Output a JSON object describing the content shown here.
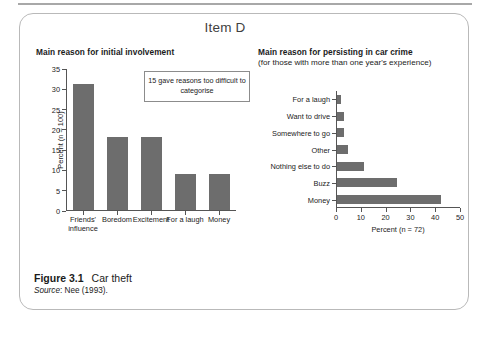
{
  "item": {
    "title": "Item D"
  },
  "left_chart": {
    "title": "Main reason for initial involvement",
    "note": "15 gave reasons too difficult to categorise"
  },
  "right_chart": {
    "title": "Main reason for persisting in car crime",
    "subtitle": "(for those with more than one year's experience)"
  },
  "caption": {
    "figure_number": "Figure 3.1",
    "figure_title": "Car theft",
    "source_label": "Source",
    "source_text": ": Nee (1993)."
  },
  "colors": {
    "bar": "#6d6d6d",
    "axis": "#555555",
    "box_border": "#b9b9b9",
    "note_border": "#8c8c8c",
    "rule": "#a8a8a8"
  },
  "chart_data": [
    {
      "type": "bar",
      "orientation": "vertical",
      "title": "Main reason for initial involvement",
      "categories": [
        "Friends' influence",
        "Boredom",
        "Excitement",
        "For a laugh",
        "Money"
      ],
      "values": [
        31,
        18,
        18,
        9,
        9
      ],
      "xlabel": "",
      "ylabel": "Percent (n = 100)",
      "ylim": [
        0,
        35
      ],
      "yticks": [
        0,
        5,
        10,
        15,
        20,
        25,
        30,
        35
      ],
      "grid": false,
      "legend": "none",
      "annotation": "15 gave reasons too difficult to categorise"
    },
    {
      "type": "bar",
      "orientation": "horizontal",
      "title": "Main reason for persisting in car crime",
      "subtitle": "(for those with more than one year's experience)",
      "categories": [
        "For a laugh",
        "Want to drive",
        "Somewhere to go",
        "Other",
        "Nothing else to do",
        "Buzz",
        "Money"
      ],
      "values": [
        1.5,
        3,
        3,
        4.5,
        11,
        24,
        42
      ],
      "xlabel": "Percent (n = 72)",
      "ylabel": "",
      "xlim": [
        0,
        50
      ],
      "xticks": [
        0,
        10,
        20,
        30,
        40,
        50
      ],
      "grid": false,
      "legend": "none"
    }
  ]
}
